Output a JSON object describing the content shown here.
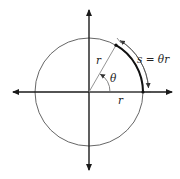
{
  "diagram": {
    "labels": {
      "radius_slanted": "r",
      "radius_horizontal": "r",
      "angle": "θ",
      "arc_formula": "s = θr"
    },
    "colors": {
      "axis": "#1a1a1a",
      "circle": "#555555",
      "arc": "#111111",
      "radius_line": "#888888",
      "text": "#222222"
    },
    "geometry": {
      "center": [
        89,
        92
      ],
      "radius": 54,
      "angle_deg": 60
    }
  }
}
